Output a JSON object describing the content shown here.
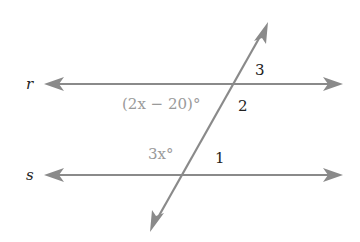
{
  "diagram": {
    "type": "parallel-lines-cut-by-transversal",
    "colors": {
      "line": "#8a8a8a",
      "label_dark": "#222222",
      "label_gray": "#9a9a9a",
      "background": "#ffffff"
    },
    "lines": [
      {
        "name": "r",
        "label": "r",
        "y": 84,
        "x1": 44,
        "x2": 343
      },
      {
        "name": "s",
        "label": "s",
        "y": 175,
        "x1": 44,
        "x2": 343
      }
    ],
    "transversal": {
      "x1": 150,
      "y1": 232,
      "x2": 268,
      "y2": 22
    },
    "angle_labels": {
      "angle_3": "3",
      "angle_2": "2",
      "angle_1": "1",
      "expr_r": "(2x − 20)°",
      "expr_s": "3x°"
    }
  }
}
